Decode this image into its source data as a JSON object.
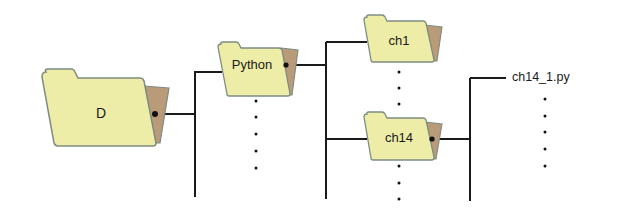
{
  "diagram": {
    "type": "directory-tree",
    "colors": {
      "folder_body": "#eeeda8",
      "folder_border": "#7d8c80",
      "folder_back": "#b99b79",
      "line": "#1a1a1a",
      "text": "#1a1a1a"
    },
    "nodes": {
      "root": {
        "label": "D",
        "kind": "folder"
      },
      "python": {
        "label": "Python",
        "kind": "folder"
      },
      "ch1": {
        "label": "ch1",
        "kind": "folder"
      },
      "ch14": {
        "label": "ch14",
        "kind": "folder"
      },
      "file": {
        "label": "ch14_1.py",
        "kind": "file"
      }
    },
    "edges": [
      {
        "from": "D",
        "to": "Python"
      },
      {
        "from": "Python",
        "to": "ch1"
      },
      {
        "from": "Python",
        "to": "ch14"
      },
      {
        "from": "ch14",
        "to": "ch14_1.py"
      }
    ],
    "ellipsis_markers": [
      "below Python",
      "between ch1 and ch14",
      "below ch14",
      "below ch14_1.py"
    ]
  }
}
